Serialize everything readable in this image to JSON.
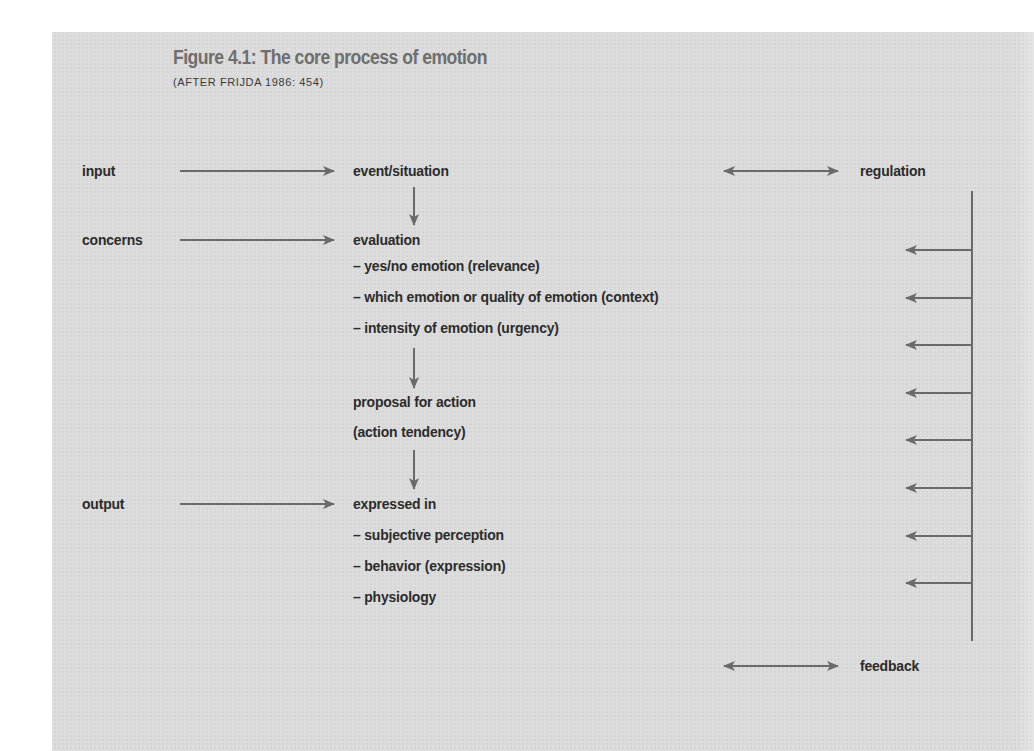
{
  "figure": {
    "title": "Figure 4.1: The core process of emotion",
    "subtitle": "(AFTER FRIJDA 1986: 454)"
  },
  "left_column": {
    "input": "input",
    "concerns": "concerns",
    "output": "output"
  },
  "center_column": {
    "event": "event/situation",
    "evaluation": "evaluation",
    "evaluation_items": [
      "– yes/no emotion (relevance)",
      "– which emotion or quality of emotion (context)",
      "– intensity of emotion (urgency)"
    ],
    "proposal_line1": "proposal for action",
    "proposal_line2": "(action tendency)",
    "expressed": "expressed in",
    "expressed_items": [
      "– subjective perception",
      "– behavior (expression)",
      "– physiology"
    ]
  },
  "right_column": {
    "regulation": "regulation",
    "feedback": "feedback",
    "regulation_arrow_count": 8
  },
  "colors": {
    "panel_bg": "#dcdcdc",
    "title": "#6e6e6e",
    "text": "#2b2b2b",
    "arrow": "#6a6a6a"
  }
}
